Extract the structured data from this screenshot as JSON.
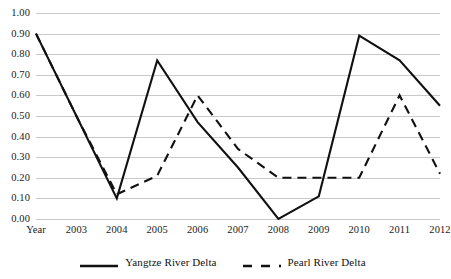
{
  "chart_data": {
    "type": "line",
    "title": "",
    "xlabel": "",
    "ylabel": "",
    "categories": [
      "Year",
      "2003",
      "2004",
      "2005",
      "2006",
      "2007",
      "2008",
      "2009",
      "2010",
      "2011",
      "2012"
    ],
    "ylim": [
      0.0,
      1.0
    ],
    "ytick_labels": [
      "1.00",
      "0.90",
      "0.80",
      "0.70",
      "0.60",
      "0.50",
      "0.40",
      "0.30",
      "0.20",
      "0.10",
      "0.00"
    ],
    "ytick_values": [
      1.0,
      0.9,
      0.8,
      0.7,
      0.6,
      0.5,
      0.4,
      0.3,
      0.2,
      0.1,
      0.0
    ],
    "grid": true,
    "legend_position": "bottom",
    "series": [
      {
        "name": "Yangtze River Delta",
        "style": "solid",
        "color": "#111111",
        "values": [
          0.9,
          0.5,
          0.1,
          0.77,
          0.47,
          0.25,
          0.0,
          0.11,
          0.89,
          0.77,
          0.55
        ]
      },
      {
        "name": "Pearl River Delta",
        "style": "dashed",
        "color": "#111111",
        "values": [
          0.9,
          0.5,
          0.12,
          0.21,
          0.6,
          0.34,
          0.2,
          0.2,
          0.2,
          0.6,
          0.22
        ]
      }
    ]
  },
  "legend": {
    "entries": [
      {
        "label": "Yangtze River Delta",
        "style": "solid"
      },
      {
        "label": "Pearl River Delta",
        "style": "dashed"
      }
    ]
  },
  "colors": {
    "grid": "#c9c9c9",
    "line": "#111111",
    "background": "#ffffff",
    "text": "#1a1a1a"
  }
}
